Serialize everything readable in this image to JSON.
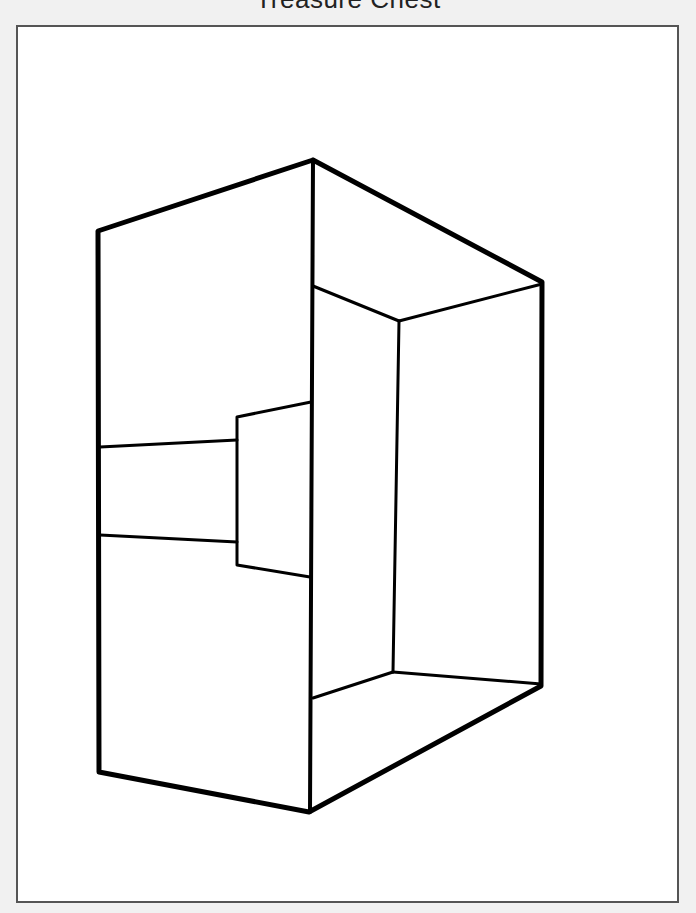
{
  "title": "Treasure Chest",
  "colors": {
    "background": "#f1f1f1",
    "page": "#ffffff",
    "frame_border": "#555555",
    "line": "#000000"
  },
  "drawing": {
    "subject": "treasure chest outline (perspective box)",
    "outer_vertices": {
      "top_left": [
        98,
        231
      ],
      "top_center": [
        313,
        160
      ],
      "top_right": [
        542,
        282
      ],
      "bottom_right": [
        541,
        686
      ],
      "bottom_center": [
        309,
        812
      ],
      "bottom_left": [
        99,
        772
      ]
    },
    "inner_vertices": {
      "back_top": [
        399,
        321
      ],
      "back_bottom": [
        393,
        672
      ],
      "front_top_inner": [
        313,
        286
      ],
      "front_bottom_inner": [
        313,
        698
      ]
    },
    "lock": {
      "top_left": [
        237,
        417
      ],
      "top_right": [
        311,
        402
      ],
      "bottom_right": [
        310,
        577
      ],
      "bottom_left": [
        237,
        565
      ]
    },
    "band": {
      "upper": [
        [
          100,
          447
        ],
        [
          237,
          440
        ]
      ],
      "lower": [
        [
          100,
          535
        ],
        [
          237,
          542
        ]
      ]
    }
  }
}
